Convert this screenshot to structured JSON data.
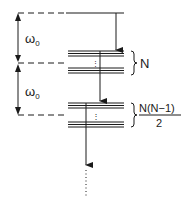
{
  "diagram": {
    "type": "energy-level-diagram",
    "colors": {
      "ink": "#1a1a1a",
      "background": "#ffffff"
    },
    "spacing_labels": [
      {
        "symbol": "ω",
        "subscript": "0"
      },
      {
        "symbol": "ω",
        "subscript": "0"
      }
    ],
    "levels": [
      {
        "name": "top-level",
        "degeneracy_label": ""
      },
      {
        "name": "one-excitation-band",
        "degeneracy_label": "N"
      },
      {
        "name": "two-excitation-band",
        "degeneracy_numerator": "N(N−1)",
        "degeneracy_denominator": "2"
      }
    ],
    "band_ellipsis": "⋮",
    "continuation": "⋮"
  }
}
